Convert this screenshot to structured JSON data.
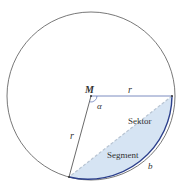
{
  "diagram": {
    "type": "circle-sector-segment",
    "circle": {
      "cx": 91,
      "cy": 96,
      "r": 84,
      "stroke": "#555555"
    },
    "points": {
      "center": {
        "x": 91,
        "y": 96
      },
      "right": {
        "x": 172,
        "y": 96
      },
      "bottom_left": {
        "x": 69,
        "y": 177
      }
    },
    "colors": {
      "segment_fill": "#d6e4f3",
      "arc_highlight": "#2b3f8c",
      "radius_right": "#5a6fb0",
      "chord": "#b8c4d2",
      "outline": "#555555"
    },
    "labels": {
      "center": "M",
      "radius_top": "r",
      "radius_left": "r",
      "angle": "α",
      "sector": "Sektor",
      "segment": "Segment",
      "arc": "b"
    }
  }
}
